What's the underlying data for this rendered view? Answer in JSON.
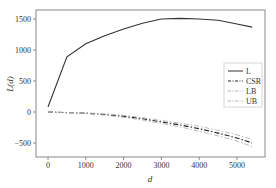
{
  "chart_data": {
    "type": "line",
    "title": "",
    "xlabel": "d",
    "ylabel": "L(d)",
    "xlim": [
      -300,
      5800
    ],
    "ylim": [
      -750,
      1650
    ],
    "xticks": [
      0,
      1000,
      2000,
      3000,
      4000,
      5000
    ],
    "yticks": [
      -500,
      0,
      500,
      1000,
      1500
    ],
    "grid": false,
    "legend_position": "center right",
    "x": [
      0,
      500,
      1000,
      1500,
      2000,
      2500,
      3000,
      3500,
      4000,
      4500,
      5000,
      5400
    ],
    "series": [
      {
        "name": "L",
        "style": "solid",
        "color": "#333333",
        "values": [
          80,
          890,
          1100,
          1230,
          1340,
          1430,
          1500,
          1510,
          1500,
          1480,
          1420,
          1370
        ]
      },
      {
        "name": "CSR",
        "style": "dashdot",
        "color": "#222222",
        "values": [
          0,
          -10,
          -20,
          -40,
          -70,
          -110,
          -160,
          -210,
          -270,
          -340,
          -420,
          -500
        ]
      },
      {
        "name": "LB",
        "style": "dashdot",
        "color": "#aaaaaa",
        "values": [
          0,
          -12,
          -25,
          -50,
          -85,
          -130,
          -185,
          -240,
          -310,
          -385,
          -470,
          -560
        ]
      },
      {
        "name": "UB",
        "style": "dashdot",
        "color": "#aaaaaa",
        "values": [
          0,
          -8,
          -15,
          -30,
          -55,
          -90,
          -135,
          -180,
          -230,
          -295,
          -370,
          -440
        ]
      }
    ]
  }
}
